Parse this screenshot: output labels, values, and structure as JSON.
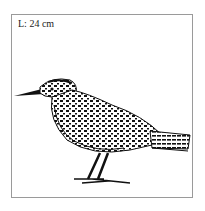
{
  "illustration": {
    "length_label": "L: 24 cm",
    "subject": "bird-icon",
    "border_color": "#9a9a9a",
    "ink_color": "#111111"
  }
}
